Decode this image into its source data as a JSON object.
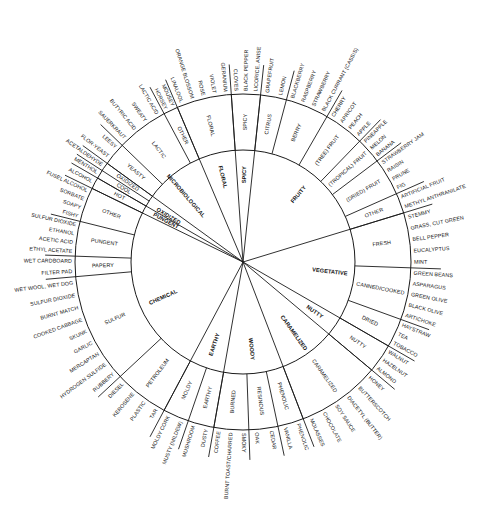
{
  "diagram": {
    "center": [
      243,
      262
    ],
    "radii": {
      "inner": 112,
      "middle": 168
    },
    "colors": {
      "line": "#1a1a1a",
      "text": "#111111",
      "background": "#ffffff"
    },
    "categories": [
      {
        "name": "SPICY",
        "start": -94,
        "end": -84,
        "sub": [
          {
            "name": "SPICY",
            "start": -94,
            "end": -84,
            "terms": [
              "CLOVES",
              "BLACK PEPPER",
              "LICORICE, ANISE"
            ]
          }
        ]
      },
      {
        "name": "FRUITY",
        "start": -84,
        "end": -17,
        "sub": [
          {
            "name": "CITRUS",
            "start": -84,
            "end": -75,
            "terms": [
              "GRAPEFRUIT",
              "LEMON"
            ]
          },
          {
            "name": "BERRY",
            "start": -75,
            "end": -60,
            "terms": [
              "BLACKBERRY",
              "RASPBERRY",
              "STRAWBERRY",
              "BLACK CURRANT (CASSIS)"
            ]
          },
          {
            "name": "(TREE) FRUIT",
            "start": -60,
            "end": -46,
            "terms": [
              "CHERRY",
              "APRICOT",
              "PEACH",
              "APPLE"
            ]
          },
          {
            "name": "(TROPICAL) FRUIT",
            "start": -46,
            "end": -37,
            "terms": [
              "PINEAPPLE",
              "MELON",
              "BANANA"
            ]
          },
          {
            "name": "(DRIED) FRUIT",
            "start": -37,
            "end": -24,
            "terms": [
              "STRAWBERRY JAM",
              "RAISIN",
              "PRUNE",
              "FIG"
            ]
          },
          {
            "name": "OTHER",
            "start": -24,
            "end": -17,
            "terms": [
              "ARTIFICIAL FRUIT",
              "METHYL ANTHRANILATE"
            ]
          }
        ]
      },
      {
        "name": "VEGETATIVE",
        "start": -17,
        "end": 30,
        "sub": [
          {
            "name": "FRESH",
            "start": -17,
            "end": 2,
            "terms": [
              "STEMMY",
              "GRASS, CUT GREEN",
              "BELL PEPPER",
              "EUCALYPTUS",
              "MINT"
            ]
          },
          {
            "name": "CANNED/COOKED",
            "start": 2,
            "end": 20,
            "terms": [
              "GREEN BEANS",
              "ASPARAGUS",
              "GREEN OLIVE",
              "BLACK OLIVE",
              "ARTICHOKE"
            ]
          },
          {
            "name": "DRIED",
            "start": 20,
            "end": 30,
            "terms": [
              "HAYSTRAW",
              "TEA",
              "TOBACCO"
            ]
          }
        ]
      },
      {
        "name": "NUTTY",
        "start": 30,
        "end": 40,
        "sub": [
          {
            "name": "NUTTY",
            "start": 30,
            "end": 40,
            "terms": [
              "WALNUT",
              "HAZELNUT",
              "ALMOND"
            ]
          }
        ]
      },
      {
        "name": "CARAMELIZED",
        "start": 40,
        "end": 69,
        "sub": [
          {
            "name": "CARAMELIZED",
            "start": 40,
            "end": 69,
            "terms": [
              "HONEY",
              "BUTTERSCOTCH",
              "DIACETYL (BUTTER)",
              "SOY SAUCE",
              "CHOCOLATE",
              "MOLASSES"
            ]
          }
        ]
      },
      {
        "name": "WOODY",
        "start": 69,
        "end": 100,
        "sub": [
          {
            "name": "PHENOLIC",
            "start": 69,
            "end": 78,
            "terms": [
              "PHENOLIC",
              "VANILLA"
            ]
          },
          {
            "name": "RESINOUS",
            "start": 78,
            "end": 88,
            "terms": [
              "CEDAR",
              "OAK"
            ]
          },
          {
            "name": "BURNED",
            "start": 88,
            "end": 100,
            "terms": [
              "SMOKY",
              "BURNT TOAST/CHARRED",
              "COFFEE"
            ]
          }
        ]
      },
      {
        "name": "EARTHY",
        "start": 100,
        "end": 118,
        "sub": [
          {
            "name": "EARTHY",
            "start": 100,
            "end": 109,
            "terms": [
              "DUSTY",
              "MUSHROOM"
            ]
          },
          {
            "name": "MOLDY",
            "start": 109,
            "end": 118,
            "terms": [
              "MUSTY (MILDEW)",
              "MOLDY CORK"
            ]
          }
        ]
      },
      {
        "name": "CHEMICAL",
        "start": 118,
        "end": 194,
        "sub": [
          {
            "name": "PETROLEUM",
            "start": 118,
            "end": 137,
            "terms": [
              "TAR",
              "PLASTIC",
              "KEROSENE",
              "DIESEL"
            ]
          },
          {
            "name": "SULFUR",
            "start": 137,
            "end": 175,
            "terms": [
              "RUBBERY",
              "HYDROGEN SULFIDE",
              "MERCAPTAN",
              "GARLIC",
              "SKUNK",
              "COOKED CABBAGE",
              "BURNT MATCH",
              "SULFUR DIOXIDE",
              "WET WOOL, WET DOG"
            ]
          },
          {
            "name": "PAPERY",
            "start": 175,
            "end": 182,
            "terms": [
              "FILTER PAD",
              "WET CARDBOARD"
            ]
          },
          {
            "name": "PUNGENT",
            "start": 182,
            "end": 194,
            "terms": [
              "ETHYL ACETATE",
              "ACETIC ACID",
              "ETHANOL",
              "SULFUR DIOXIDE"
            ]
          },
          {
            "name": "OTHER",
            "start": 194,
            "end": 206,
            "terms": [
              "FISHY",
              "SOAPY",
              "SORBATE",
              "FUSEL ALCOHOL"
            ]
          }
        ]
      },
      {
        "name": "PUNGENT",
        "start": 206,
        "end": 210,
        "sub": [
          {
            "name": "HOT",
            "start": 206,
            "end": 210,
            "terms": [
              "ALCOHOL"
            ]
          }
        ]
      },
      {
        "name": "OXIDIZED",
        "start": 210,
        "end": 213,
        "sub": [
          {
            "name": "COOL",
            "start": 210,
            "end": 213,
            "terms": [
              "MENTHOL"
            ]
          },
          {
            "name": "OXIDIZED",
            "start": 213,
            "end": 216,
            "terms": [
              "ACETALDEHYDE"
            ]
          }
        ]
      },
      {
        "name": "MICROBIOLOGICAL",
        "start": 216,
        "end": 242,
        "sub": [
          {
            "name": "YEASTY",
            "start": 216,
            "end": 224,
            "terms": [
              "FLOR-YEAST",
              "LEESY"
            ]
          },
          {
            "name": "LACTIC",
            "start": 224,
            "end": 242,
            "terms": [
              "SAUERKRAUT",
              "BUTYRIC ACID",
              "SWEATY",
              "LACTIC ACID"
            ]
          },
          {
            "name": "OTHER",
            "start": 242,
            "end": 247,
            "terms": [
              "HORSEY",
              "MOUSEY"
            ]
          }
        ]
      },
      {
        "name": "FLORAL",
        "start": 247,
        "end": 266,
        "sub": [
          {
            "name": "FLORAL",
            "start": 247,
            "end": 266,
            "terms": [
              "LINALOOL",
              "ORANGE BLOSSOM",
              "ROSE",
              "VIOLET",
              "GERANIUM"
            ]
          }
        ]
      }
    ]
  }
}
